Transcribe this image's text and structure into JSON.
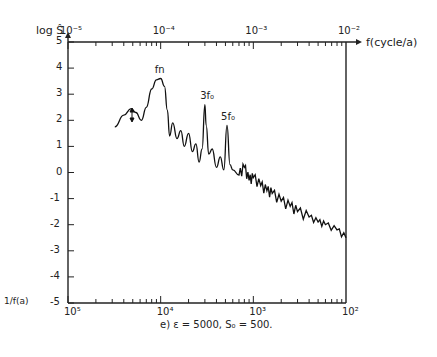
{
  "chart_data": {
    "type": "line",
    "title": "",
    "caption": "e) ε = 5000, S₀ = 500.",
    "xlabel": "f(cycle/a)",
    "xlabel_bottom": "1/f(a)",
    "ylabel": "log Ŝ",
    "xscale": "log",
    "xlim": [
      1e-05,
      0.01
    ],
    "ylim": [
      -5,
      5
    ],
    "x_top_ticks": [
      "10⁻⁵",
      "10⁻⁴",
      "10⁻³",
      "10⁻²"
    ],
    "x_bottom_ticks": [
      "10⁵",
      "10⁴",
      "10³",
      "10²"
    ],
    "y_ticks": [
      "5",
      "4",
      "3",
      "2",
      "1",
      "0",
      "-1",
      "-2",
      "-3",
      "-4",
      "-5"
    ],
    "annotations": [
      {
        "text": "fn",
        "x": 0.0001,
        "y": 3.6
      },
      {
        "text": "3f₀",
        "x": 0.00031,
        "y": 2.6
      },
      {
        "text": "5f₀",
        "x": 0.00052,
        "y": 1.8
      },
      {
        "text": "↕",
        "x": 5.4e-05,
        "y": 2.3
      }
    ],
    "series": [
      {
        "name": "log S spectrum",
        "x": [
          3.2e-05,
          4e-05,
          4.8e-05,
          5.4e-05,
          6.2e-05,
          7e-05,
          8e-05,
          9e-05,
          0.0001,
          0.00011,
          0.000118,
          0.000125,
          0.000135,
          0.00015,
          0.000165,
          0.00018,
          0.0002,
          0.00022,
          0.00024,
          0.00026,
          0.00028,
          0.0003,
          0.00031,
          0.00033,
          0.00036,
          0.0004,
          0.00044,
          0.00048,
          0.00052,
          0.00056,
          0.0006,
          0.0007,
          0.0008,
          0.0009,
          0.001,
          0.0012,
          0.0014,
          0.0016,
          0.002,
          0.0025,
          0.003,
          0.004,
          0.005,
          0.006,
          0.008,
          0.01
        ],
        "y": [
          1.75,
          2.2,
          2.45,
          2.3,
          2.0,
          2.5,
          3.2,
          3.55,
          3.6,
          3.3,
          2.4,
          1.4,
          1.9,
          1.3,
          1.6,
          1.0,
          1.5,
          0.8,
          1.1,
          0.4,
          0.9,
          2.6,
          1.8,
          0.7,
          0.9,
          0.2,
          0.6,
          0.1,
          1.8,
          0.3,
          0.1,
          -0.1,
          0.2,
          -0.3,
          -0.2,
          -0.5,
          -0.7,
          -0.8,
          -1.1,
          -1.3,
          -1.5,
          -1.7,
          -1.9,
          -2.0,
          -2.2,
          -2.5
        ]
      }
    ],
    "grid": false
  }
}
